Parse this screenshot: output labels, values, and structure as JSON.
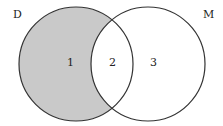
{
  "diagram": {
    "type": "venn",
    "sets": [
      {
        "name": "D",
        "label": "D",
        "shaded": "only"
      },
      {
        "name": "M",
        "label": "M",
        "shaded": "none"
      }
    ],
    "regions": [
      {
        "id": "1",
        "label": "1",
        "description": "D only",
        "shaded": true
      },
      {
        "id": "2",
        "label": "2",
        "description": "D and M",
        "shaded": false
      },
      {
        "id": "3",
        "label": "3",
        "description": "M only",
        "shaded": false
      }
    ],
    "colors": {
      "shade": "#c9c9c9",
      "stroke": "#333333",
      "background": "#ffffff"
    }
  }
}
